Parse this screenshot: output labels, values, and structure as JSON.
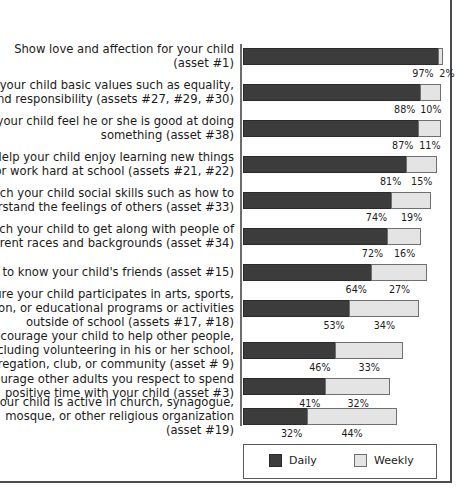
{
  "chart_data": {
    "type": "bar",
    "orientation": "horizontal",
    "stacked": true,
    "title": "",
    "subtitle": "",
    "xlabel": "",
    "ylabel": "",
    "xlim": [
      0,
      100
    ],
    "grid": false,
    "legend_position": "bottom",
    "categories": [
      "Show love and affection for your child\n(asset #1)",
      "Teach your child basic values such as equality,\nhonesty, and responsibility (assets #27, #29, #30)",
      "Help your child feel he or she is good at doing\nsomething (asset #38)",
      "Help your child enjoy learning new things\nor work hard at school  (assets #21, #22)",
      "Teach your child social skills such as how to\nunderstand the feelings of others (asset #33)",
      "Teach your child to get along with people of\ndifferent races and backgrounds (asset #34)",
      "Get to know your child's friends (asset #15)",
      "Ensure your child participates in arts, sports,\nrecreation, or educational programs or activities\noutside of school (assets #17, #18)",
      "Encourage your child to help other people,\nincluding volunteering in his or her school,\ncongregation, club, or community (asset # 9)",
      "Encourage other adults you respect to spend\npositive time with your child (asset #3)",
      "Ensure your child is active in church, synagogue,\nmosque, or other religious organization\n(asset #19)"
    ],
    "series": [
      {
        "name": "Daily",
        "color": "#3c3c3c",
        "values": [
          97,
          88,
          87,
          81,
          74,
          72,
          64,
          53,
          46,
          41,
          32
        ],
        "labels": [
          "97%",
          "88%",
          "87%",
          "81%",
          "74%",
          "72%",
          "64%",
          "53%",
          "46%",
          "41%",
          "32%"
        ]
      },
      {
        "name": "Weekly",
        "color": "#e4e4e4",
        "values": [
          2,
          10,
          11,
          15,
          19,
          16,
          27,
          34,
          33,
          32,
          44
        ],
        "labels": [
          "2%",
          "10%",
          "11%",
          "15%",
          "19%",
          "16%",
          "27%",
          "34%",
          "33%",
          "32%",
          "44%"
        ]
      }
    ]
  },
  "legend": {
    "items": [
      {
        "label": "Daily",
        "color": "#3c3c3c"
      },
      {
        "label": "Weekly",
        "color": "#e4e4e4"
      }
    ]
  }
}
